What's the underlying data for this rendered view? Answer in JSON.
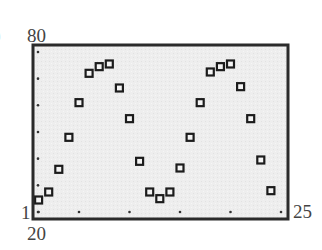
{
  "figure": {
    "part_label": ")"
  },
  "labels": {
    "ymax": "80",
    "ymin": "20",
    "xmin": "1",
    "xmax": "25"
  },
  "colors": {
    "plot_background": "#eeeeee",
    "frame": "#2b2b2b",
    "marker": "#1c1c1c",
    "tick": "#333333"
  },
  "chart_data": {
    "type": "scatter",
    "title": "",
    "xlabel": "",
    "ylabel": "",
    "xlim": [
      1,
      25
    ],
    "ylim": [
      20,
      80
    ],
    "x_ticks": [
      1,
      5,
      10,
      15,
      20,
      25
    ],
    "y_ticks": [
      20,
      30,
      40,
      50,
      60,
      70,
      80
    ],
    "grid": false,
    "legend": null,
    "marker": "hollow-square",
    "series": [
      {
        "name": "data",
        "x": [
          1,
          2,
          3,
          4,
          5,
          6,
          7,
          8,
          9,
          10,
          11,
          12,
          13,
          14,
          15,
          16,
          17,
          18,
          19,
          20,
          21,
          22,
          23,
          24
        ],
        "y": [
          24.5,
          27.5,
          36,
          48,
          61,
          72,
          74.5,
          75.5,
          66.5,
          55,
          39,
          27.5,
          25,
          27.5,
          36.5,
          48,
          61,
          72.5,
          74.5,
          75.5,
          67,
          55,
          39.5,
          28
        ]
      }
    ]
  }
}
